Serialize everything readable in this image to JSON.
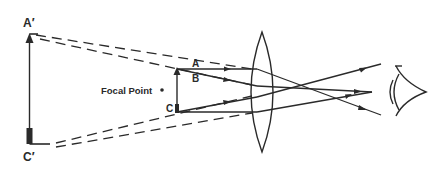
{
  "diagram": {
    "stroke_color": "#2a2a2a",
    "labels": {
      "virtual_top": "A′",
      "virtual_bottom": "C′",
      "object_top_ray": "A",
      "object_mid_ray": "B",
      "object_bottom": "C",
      "focal_point": "Focal Point"
    },
    "elements": {
      "virtual_image": "virtual image arrow A′–C′",
      "object": "object arrow at C",
      "lens": "convex lens",
      "eye": "eye"
    }
  }
}
